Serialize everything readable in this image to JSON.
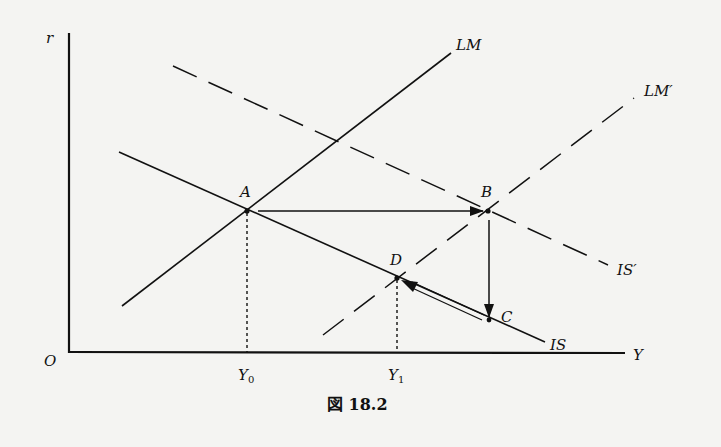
{
  "diagram": {
    "caption": "図 18.2",
    "axes": {
      "y_label": "r",
      "x_label": "Y",
      "origin_label": "O"
    },
    "curves": {
      "LM": "LM",
      "LM_prime": "LM′",
      "IS": "IS",
      "IS_prime": "IS′"
    },
    "points": {
      "A": "A",
      "B": "B",
      "C": "C",
      "D": "D"
    },
    "ticks": {
      "Y0": "Y",
      "Y0_sub": "0",
      "Y1": "Y",
      "Y1_sub": "1"
    },
    "colors": {
      "ink": "#111111",
      "background": "#f4f4f2"
    }
  }
}
